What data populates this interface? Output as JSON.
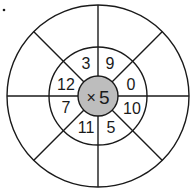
{
  "diagram": {
    "type": "multiplication-wheel",
    "center_label": "× 5",
    "operator": "×",
    "multiplier": "5",
    "inner_ring_numbers": [
      {
        "position": "top-left",
        "value": "3"
      },
      {
        "position": "top-right",
        "value": "9"
      },
      {
        "position": "right-top",
        "value": "0"
      },
      {
        "position": "right-bottom",
        "value": "10"
      },
      {
        "position": "bottom-right",
        "value": "5"
      },
      {
        "position": "bottom-left",
        "value": "11"
      },
      {
        "position": "left-bottom",
        "value": "7"
      },
      {
        "position": "left-top",
        "value": "12"
      }
    ],
    "outer_ring_answers": [
      "",
      "",
      "",
      "",
      "",
      "",
      "",
      ""
    ],
    "colors": {
      "center_fill": "#bdbdbd",
      "line": "#1a1a1a",
      "background": "#ffffff"
    }
  }
}
